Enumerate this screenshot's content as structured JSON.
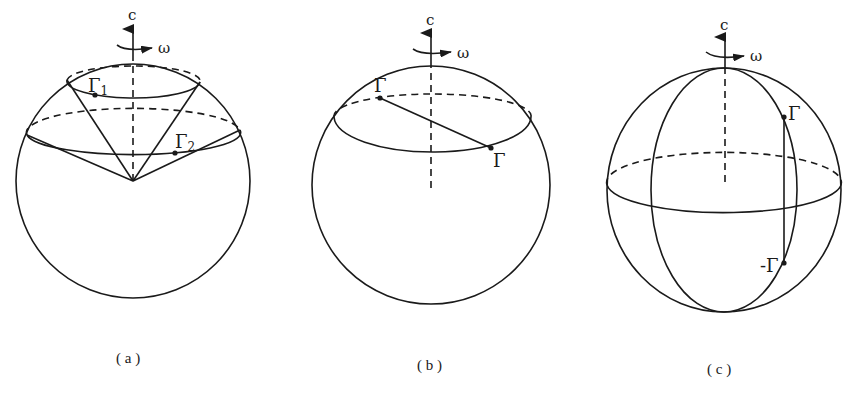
{
  "figure": {
    "panels": [
      {
        "id": "a",
        "caption": "( a )",
        "axis_label": "c",
        "rotation_label": "ω",
        "points": [
          {
            "label": "Γ",
            "subscript": "1"
          },
          {
            "label": "Γ",
            "subscript": "2"
          }
        ]
      },
      {
        "id": "b",
        "caption": "( b )",
        "axis_label": "c",
        "rotation_label": "ω",
        "points": [
          {
            "label": "Γ"
          },
          {
            "label": "Γ"
          }
        ]
      },
      {
        "id": "c",
        "caption": "( c )",
        "axis_label": "c",
        "rotation_label": "ω",
        "points": [
          {
            "label": "Γ"
          },
          {
            "label": "-Γ"
          }
        ]
      }
    ],
    "colors": {
      "ink": "#1a1a1a",
      "background": "#ffffff"
    }
  }
}
